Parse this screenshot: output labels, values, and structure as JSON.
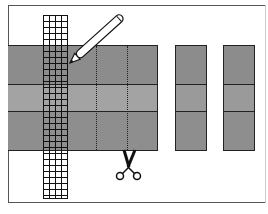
{
  "diagram": {
    "colors": {
      "top_band": "#8c8c8c",
      "middle_band": "#a3a3a3",
      "bottom_band": "#8e8e8e",
      "outline": "#222222",
      "background": "#ffffff"
    },
    "elements": {
      "frame": "rectangular border frame",
      "main_sheet": {
        "bands": 3,
        "dotted_cut_lines": 2
      },
      "cut_strips": {
        "count": 2,
        "bands_each": 3
      },
      "grid_ruler": {
        "columns": 4
      },
      "pencil_icon": "pencil marking cut line",
      "scissors_icon": "scissors cutting along dotted line"
    }
  }
}
